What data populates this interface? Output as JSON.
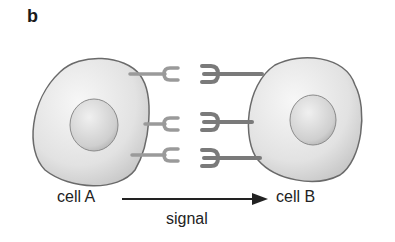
{
  "panel": {
    "label": "b"
  },
  "cells": [
    {
      "name": "cell A",
      "role": "sender"
    },
    {
      "name": "cell B",
      "role": "receiver"
    }
  ],
  "arrow": {
    "label": "signal",
    "direction": "cell A to cell B"
  },
  "ligand_count": 3,
  "receptor_count": 3,
  "colors": {
    "cell_fill": "#e6e6e6",
    "cell_outline": "#6a6a6a",
    "nucleus_fill": "#d4d4d4",
    "stalk": "#9a9a9a",
    "receptor": "#7a7a7a",
    "text": "#222222"
  }
}
